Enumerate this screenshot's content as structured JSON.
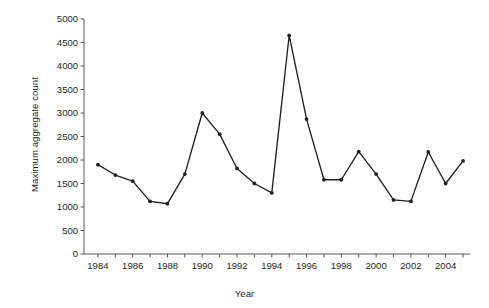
{
  "chart_data": {
    "type": "line",
    "title": "",
    "xlabel": "Year",
    "ylabel": "Maximum aggregate count",
    "xlim": [
      1983.2,
      2005.4
    ],
    "ylim": [
      0,
      5000
    ],
    "grid": false,
    "legend": "none",
    "x_tick_labels": [
      "1984",
      "1986",
      "1988",
      "1990",
      "1992",
      "1994",
      "1996",
      "1998",
      "2000",
      "2002",
      "2004"
    ],
    "x_tick_values": [
      1984,
      1986,
      1988,
      1990,
      1992,
      1994,
      1996,
      1998,
      2000,
      2002,
      2004
    ],
    "x_minor_tick_values": [
      1985,
      1987,
      1989,
      1991,
      1993,
      1995,
      1997,
      1999,
      2001,
      2003,
      2005
    ],
    "y_tick_labels": [
      "0",
      "500",
      "1000",
      "1500",
      "2000",
      "2500",
      "3000",
      "3500",
      "4000",
      "4500",
      "5000"
    ],
    "y_tick_values": [
      0,
      500,
      1000,
      1500,
      2000,
      2500,
      3000,
      3500,
      4000,
      4500,
      5000
    ],
    "x": [
      1984,
      1985,
      1986,
      1987,
      1988,
      1989,
      1990,
      1991,
      1992,
      1993,
      1994,
      1995,
      1996,
      1997,
      1998,
      1999,
      2000,
      2001,
      2002,
      2003,
      2004,
      2005
    ],
    "values": [
      1900,
      1680,
      1550,
      1120,
      1070,
      1700,
      3000,
      2550,
      1820,
      1500,
      1300,
      4650,
      2870,
      1580,
      1580,
      2180,
      1700,
      1150,
      1120,
      2170,
      1500,
      1980
    ],
    "series": [
      {
        "name": "Maximum aggregate count",
        "color": "#231f20",
        "marker": "circle",
        "values": [
          1900,
          1680,
          1550,
          1120,
          1070,
          1700,
          3000,
          2550,
          1820,
          1500,
          1300,
          4650,
          2870,
          1580,
          1580,
          2180,
          1700,
          1150,
          1120,
          2170,
          1500,
          1980
        ]
      }
    ]
  },
  "axes": {
    "x_title": "Year",
    "y_title": "Maximum aggregate count"
  }
}
